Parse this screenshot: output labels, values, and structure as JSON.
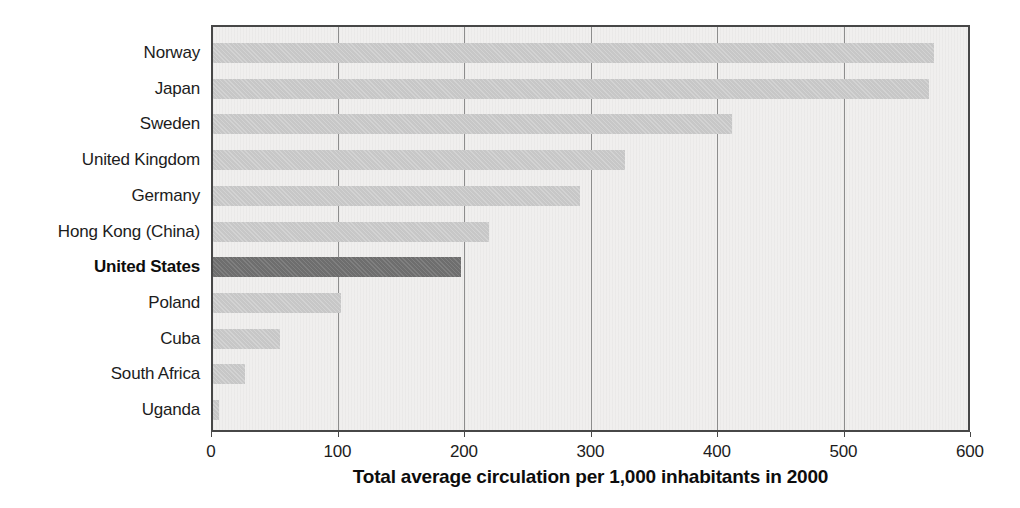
{
  "chart_data": {
    "type": "bar",
    "orientation": "horizontal",
    "title": "",
    "xlabel": "Total average circulation per 1,000 inhabitants in 2000",
    "ylabel": "",
    "categories": [
      "Norway",
      "Japan",
      "Sweden",
      "United Kingdom",
      "Germany",
      "Hong Kong (China)",
      "United States",
      "Poland",
      "Cuba",
      "South Africa",
      "Uganda"
    ],
    "values": [
      570,
      566,
      410,
      326,
      290,
      218,
      196,
      101,
      53,
      25,
      5
    ],
    "highlight_category": "United States",
    "xlim": [
      0,
      600
    ],
    "xticks": [
      0,
      100,
      200,
      300,
      400,
      500,
      600
    ],
    "grid": true,
    "legend": "none",
    "colors": {
      "bar": "#c7c7c7",
      "highlight_bar": "#6e6e6e",
      "plot_background": "#f0efee",
      "gridline": "#8d8d8d",
      "border": "#474747",
      "text": "#1c1c1c"
    }
  }
}
